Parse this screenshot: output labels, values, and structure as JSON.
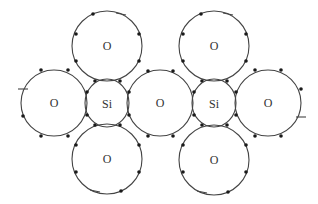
{
  "diagram": {
    "atoms": [
      {
        "id": "o-top-left",
        "label": "O",
        "cx": 107,
        "cy": 46,
        "r": 35
      },
      {
        "id": "o-top-right",
        "label": "O",
        "cx": 214,
        "cy": 46,
        "r": 35
      },
      {
        "id": "o-mid-left",
        "label": "O",
        "cx": 54,
        "cy": 103,
        "r": 33
      },
      {
        "id": "si-left",
        "label": "Si",
        "cx": 107,
        "cy": 103,
        "r": 22
      },
      {
        "id": "o-center",
        "label": "O",
        "cx": 160,
        "cy": 103,
        "r": 33
      },
      {
        "id": "si-right",
        "label": "Si",
        "cx": 214,
        "cy": 103,
        "r": 22
      },
      {
        "id": "o-mid-right",
        "label": "O",
        "cx": 268,
        "cy": 103,
        "r": 33
      },
      {
        "id": "o-bottom-left",
        "label": "O",
        "cx": 107,
        "cy": 159,
        "r": 35
      },
      {
        "id": "o-bottom-right",
        "label": "O",
        "cx": 214,
        "cy": 160,
        "r": 35
      }
    ],
    "labels": {
      "o_top_left": "O",
      "o_top_right": "O",
      "o_mid_left": "O",
      "si_left": "Si",
      "o_center": "O",
      "si_right": "Si",
      "o_mid_right": "O",
      "o_bottom_left": "O",
      "o_bottom_right": "O"
    },
    "colors": {
      "stroke": "#444444",
      "electron": "#1a1a1a",
      "background": "#ffffff"
    }
  }
}
